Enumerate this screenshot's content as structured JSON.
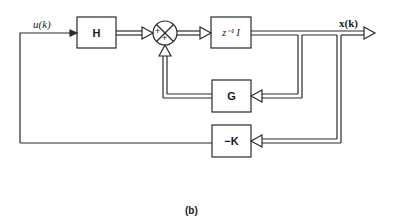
{
  "diagram": {
    "caption": "(b)",
    "signals": {
      "input": "u(k)",
      "output": "x(k)"
    },
    "blocks": {
      "h": "H",
      "delay": "z⁻¹ I",
      "g": "G",
      "k": "−K"
    },
    "summing_junction": {
      "signs": [
        "+",
        "+"
      ]
    },
    "colors": {
      "stroke": "#2a2a2a",
      "background": "#ffffff"
    }
  }
}
